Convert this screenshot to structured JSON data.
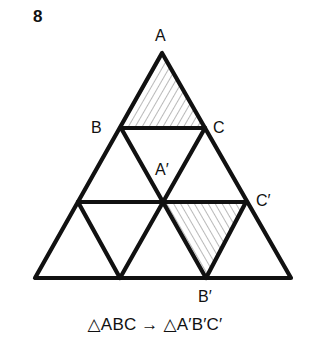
{
  "figure": {
    "number": "8",
    "caption": "△ABC → △A′B′C′"
  },
  "labels": {
    "A": "A",
    "B": "B",
    "C": "C",
    "A_prime": "A′",
    "B_prime": "B′",
    "C_prime": "C′"
  },
  "colors": {
    "stroke": "#111111",
    "hatch": "#8a8a8a",
    "background": "#ffffff"
  },
  "geometry": {
    "outer_triangle": [
      [
        162,
        53
      ],
      [
        35,
        278
      ],
      [
        291,
        278
      ]
    ],
    "grid_rows": 3,
    "shaded_triangles": [
      {
        "name": "ABC",
        "points": [
          [
            162,
            53
          ],
          [
            121,
            128
          ],
          [
            205,
            128
          ]
        ],
        "hatch_direction": "/"
      },
      {
        "name": "A'B'C'",
        "points": [
          [
            163,
            202
          ],
          [
            206,
            278
          ],
          [
            246,
            202
          ]
        ],
        "hatch_direction": "\\"
      }
    ]
  }
}
